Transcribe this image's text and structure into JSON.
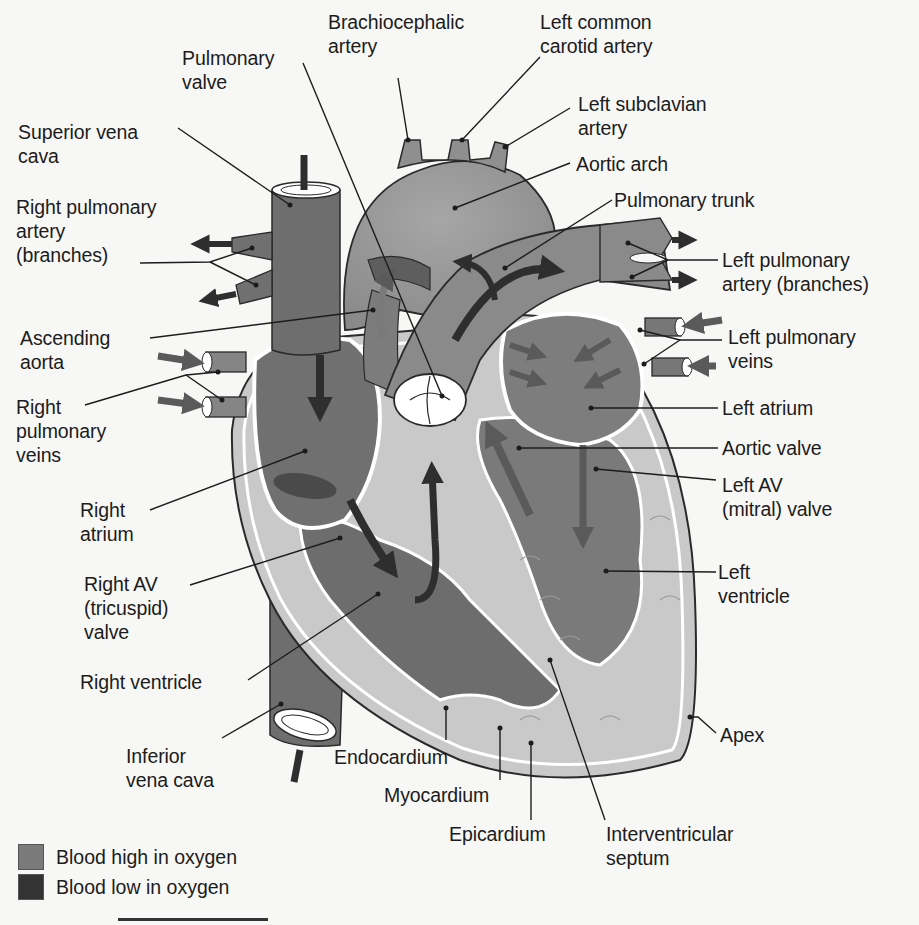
{
  "figure": {
    "colors": {
      "background": "#f7f7f5",
      "blood_high_oxygen": "#7a7a7a",
      "blood_low_oxygen": "#3a3a3a",
      "vessel_high_oxygen": "#8f8f8f",
      "vessel_low_oxygen": "#6e6e6e",
      "myocardium": "#c4c4c4",
      "endocardium": "#ffffff",
      "label_text": "#1c1c1c"
    },
    "labels": {
      "brachiocephalic_artery": "Brachiocephalic\nartery",
      "left_common_carotid_artery": "Left common\ncarotid artery",
      "pulmonary_valve": "Pulmonary\nvalve",
      "left_subclavian_artery": "Left subclavian\nartery",
      "superior_vena_cava": "Superior vena\ncava",
      "aortic_arch": "Aortic arch",
      "pulmonary_trunk": "Pulmonary trunk",
      "right_pulmonary_artery": "Right pulmonary\nartery\n(branches)",
      "left_pulmonary_artery": "Left pulmonary\nartery (branches)",
      "ascending_aorta": "Ascending\naorta",
      "left_pulmonary_veins": "Left pulmonary\nveins",
      "right_pulmonary_veins": "Right\npulmonary\nveins",
      "left_atrium": "Left atrium",
      "aortic_valve": "Aortic valve",
      "right_atrium": "Right\natrium",
      "left_av_valve": "Left AV\n(mitral) valve",
      "right_av_valve": "Right AV\n(tricuspid)\nvalve",
      "left_ventricle": "Left\nventricle",
      "right_ventricle": "Right ventricle",
      "apex": "Apex",
      "inferior_vena_cava": "Inferior\nvena cava",
      "endocardium": "Endocardium",
      "myocardium": "Myocardium",
      "epicardium": "Epicardium",
      "interventricular_septum": "Interventricular\nseptum"
    },
    "legend": [
      {
        "label": "Blood high in oxygen",
        "color": "#7a7a7a"
      },
      {
        "label": "Blood low in oxygen",
        "color": "#333333"
      }
    ]
  }
}
